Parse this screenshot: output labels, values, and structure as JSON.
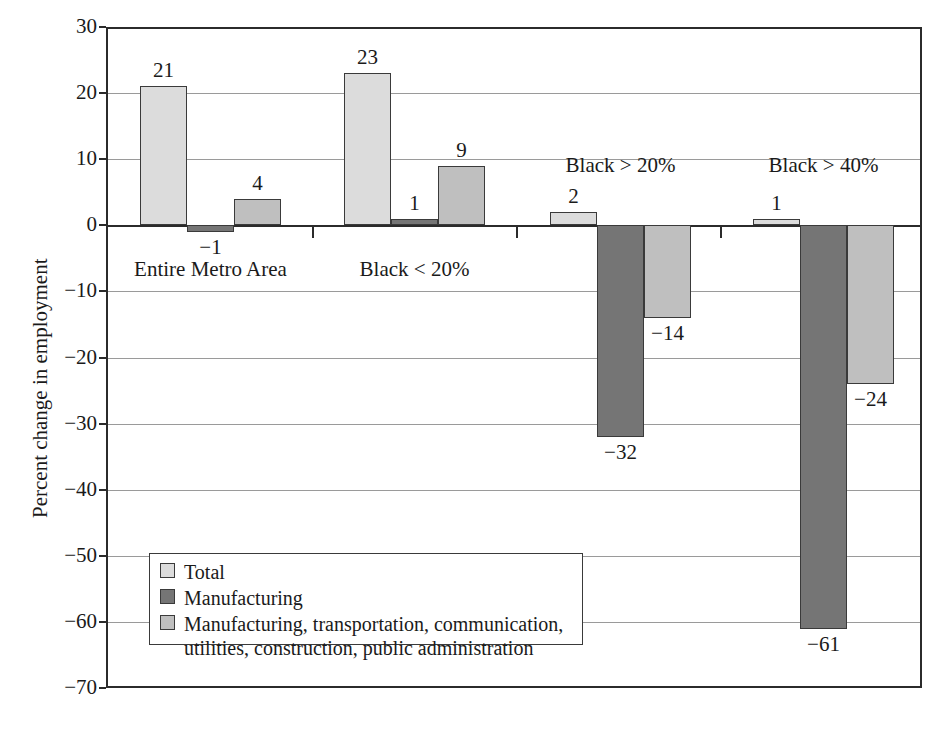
{
  "chart_data": {
    "type": "bar",
    "title": "",
    "xlabel": "",
    "ylabel": "Percent change in employment",
    "ylim": [
      -70,
      30
    ],
    "grid": true,
    "legend_position": "inside-lower-left",
    "categories": [
      "Entire Metro Area",
      "Black < 20%",
      "Black > 20%",
      "Black > 40%"
    ],
    "series": [
      {
        "name": "Total",
        "color": "#dcdcdc",
        "values": [
          21,
          23,
          2,
          1
        ]
      },
      {
        "name": "Manufacturing",
        "color": "#757575",
        "values": [
          -1,
          1,
          -32,
          -61
        ]
      },
      {
        "name": "Manufacturing, transportation, communication, utilities, construction, public administration",
        "color": "#bfbfbf",
        "values": [
          4,
          9,
          -14,
          -24
        ]
      }
    ],
    "y_ticks": [
      30,
      20,
      10,
      0,
      -10,
      -20,
      -30,
      -40,
      -50,
      -60,
      -70
    ],
    "y_tick_labels": [
      "30",
      "20",
      "10",
      "0",
      "−10",
      "−20",
      "−30",
      "−40",
      "−50",
      "−60",
      "−70"
    ],
    "bar_value_labels": [
      [
        "21",
        "−1",
        "4"
      ],
      [
        "23",
        "1",
        "9"
      ],
      [
        "2",
        "−32",
        "−14"
      ],
      [
        "1",
        "−61",
        "−24"
      ]
    ]
  },
  "axis": {
    "y_title": "Percent change in employment"
  },
  "legend": {
    "items": [
      {
        "label": "Total",
        "label_line2": ""
      },
      {
        "label": "Manufacturing",
        "label_line2": ""
      },
      {
        "label": "Manufacturing, transportation, communication,",
        "label_line2": "utilities, construction, public administration"
      }
    ]
  },
  "group_labels": [
    {
      "text": "Entire Metro Area",
      "placement": "below-axis"
    },
    {
      "text": "Black < 20%",
      "placement": "below-axis"
    },
    {
      "text": "Black > 20%",
      "placement": "above-axis"
    },
    {
      "text": "Black > 40%",
      "placement": "above-axis"
    }
  ],
  "caption": {
    "text": ""
  }
}
